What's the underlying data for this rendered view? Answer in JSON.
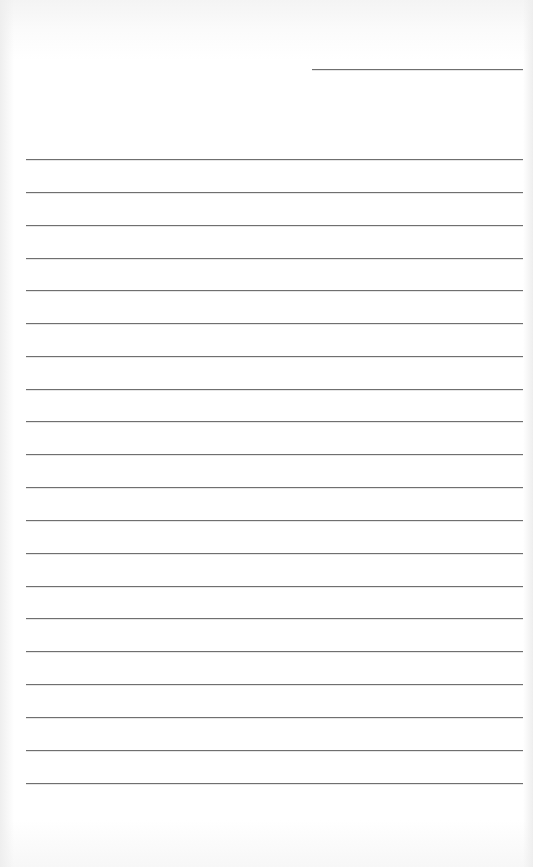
{
  "page": {
    "type": "blank lined writing paper",
    "background_color": "#ffffff",
    "line_color": "#6f6f6f"
  },
  "header_line": {
    "x": 312,
    "y": 69,
    "width": 211,
    "purpose": "date/name line",
    "value": ""
  },
  "writing_lines": [
    {
      "y": 159,
      "text": ""
    },
    {
      "y": 192,
      "text": ""
    },
    {
      "y": 225,
      "text": ""
    },
    {
      "y": 258,
      "text": ""
    },
    {
      "y": 290,
      "text": ""
    },
    {
      "y": 323,
      "text": ""
    },
    {
      "y": 356,
      "text": ""
    },
    {
      "y": 389,
      "text": ""
    },
    {
      "y": 421,
      "text": ""
    },
    {
      "y": 454,
      "text": ""
    },
    {
      "y": 487,
      "text": ""
    },
    {
      "y": 520,
      "text": ""
    },
    {
      "y": 553,
      "text": ""
    },
    {
      "y": 586,
      "text": ""
    },
    {
      "y": 618,
      "text": ""
    },
    {
      "y": 651,
      "text": ""
    },
    {
      "y": 684,
      "text": ""
    },
    {
      "y": 717,
      "text": ""
    },
    {
      "y": 750,
      "text": ""
    },
    {
      "y": 783,
      "text": ""
    }
  ]
}
